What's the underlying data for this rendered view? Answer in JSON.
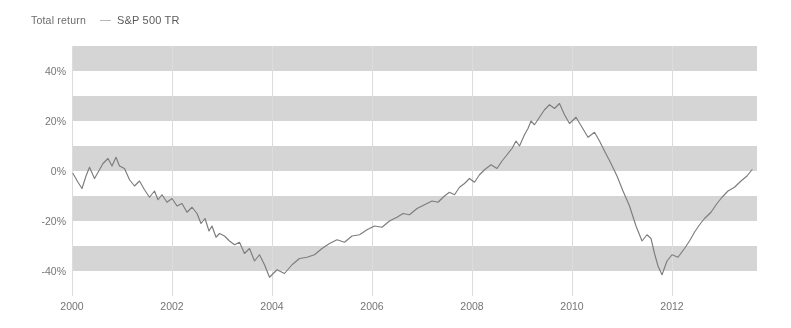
{
  "legend": {
    "title": "Total return",
    "marker_icon": "line-dash-icon",
    "series_label": "S&P 500 TR",
    "series_color": "#737373"
  },
  "colors": {
    "band": "#dedede",
    "background": "#ffffff",
    "axis_text": "#6a6a6a",
    "line": "#737373",
    "gridline": "#e6e6e6"
  },
  "chart_data": {
    "type": "line",
    "title": "Total return",
    "xlabel": "",
    "ylabel": "",
    "xlim": [
      2000.0,
      2013.7
    ],
    "ylim": [
      -50,
      50
    ],
    "yticks": [
      40,
      20,
      0,
      -20,
      -40
    ],
    "ytick_labels": [
      "40%",
      "20%",
      "0%",
      "-20%",
      "-40%"
    ],
    "xticks": [
      2000,
      2002,
      2004,
      2006,
      2008,
      2010,
      2012
    ],
    "xtick_labels": [
      "2000",
      "2002",
      "2004",
      "2006",
      "2008",
      "2010",
      "2012"
    ],
    "grid": "horizontal-bands",
    "band_interval": 10,
    "legend_position": "top-left",
    "series": [
      {
        "name": "S&P 500 TR",
        "color": "#737373",
        "x": [
          2000.02,
          2000.12,
          2000.2,
          2000.28,
          2000.35,
          2000.45,
          2000.55,
          2000.62,
          2000.72,
          2000.8,
          2000.88,
          2000.95,
          2001.05,
          2001.15,
          2001.25,
          2001.35,
          2001.45,
          2001.55,
          2001.65,
          2001.72,
          2001.8,
          2001.9,
          2002.0,
          2002.1,
          2002.2,
          2002.3,
          2002.4,
          2002.5,
          2002.58,
          2002.66,
          2002.74,
          2002.8,
          2002.88,
          2002.95,
          2003.05,
          2003.15,
          2003.25,
          2003.35,
          2003.45,
          2003.55,
          2003.65,
          2003.75,
          2003.85,
          2003.95,
          2004.1,
          2004.25,
          2004.4,
          2004.55,
          2004.7,
          2004.85,
          2005.0,
          2005.15,
          2005.3,
          2005.45,
          2005.6,
          2005.75,
          2005.9,
          2006.05,
          2006.2,
          2006.35,
          2006.5,
          2006.62,
          2006.75,
          2006.9,
          2007.05,
          2007.2,
          2007.32,
          2007.45,
          2007.55,
          2007.65,
          2007.75,
          2007.85,
          2007.95,
          2008.05,
          2008.15,
          2008.25,
          2008.38,
          2008.5,
          2008.6,
          2008.7,
          2008.8,
          2008.88,
          2008.95,
          2009.05,
          2009.12,
          2009.18,
          2009.25,
          2009.35,
          2009.45,
          2009.55,
          2009.65,
          2009.75,
          2009.85,
          2009.95,
          2010.08,
          2010.2,
          2010.32,
          2010.45,
          2010.55,
          2010.65,
          2010.78,
          2010.9,
          2011.02,
          2011.15,
          2011.28,
          2011.4,
          2011.5,
          2011.58,
          2011.65,
          2011.72,
          2011.8,
          2011.9,
          2012.0,
          2012.12,
          2012.25,
          2012.35,
          2012.45,
          2012.55,
          2012.65,
          2012.78,
          2012.9,
          2013.0,
          2013.12,
          2013.25,
          2013.38,
          2013.5,
          2013.6
        ],
        "y": [
          -1.0,
          -4.5,
          -7.0,
          -2.0,
          1.5,
          -3.0,
          0.5,
          3.0,
          5.0,
          2.0,
          5.5,
          2.0,
          1.0,
          -3.5,
          -6.0,
          -4.0,
          -7.5,
          -10.5,
          -8.0,
          -11.5,
          -9.5,
          -12.5,
          -11.0,
          -14.0,
          -13.0,
          -16.5,
          -14.5,
          -17.0,
          -21.0,
          -19.0,
          -24.0,
          -22.0,
          -26.5,
          -25.0,
          -26.0,
          -28.0,
          -29.5,
          -28.5,
          -33.0,
          -31.0,
          -36.0,
          -33.5,
          -37.5,
          -42.5,
          -39.5,
          -41.0,
          -37.5,
          -35.0,
          -34.5,
          -33.5,
          -31.0,
          -29.0,
          -27.5,
          -28.5,
          -26.0,
          -25.5,
          -23.5,
          -22.0,
          -22.5,
          -20.0,
          -18.5,
          -17.0,
          -17.5,
          -15.0,
          -13.5,
          -12.0,
          -12.5,
          -10.0,
          -8.5,
          -9.5,
          -6.5,
          -5.0,
          -3.0,
          -4.5,
          -1.5,
          0.5,
          2.5,
          1.0,
          4.0,
          6.5,
          9.0,
          12.0,
          10.0,
          14.5,
          17.0,
          20.0,
          18.5,
          21.5,
          24.5,
          26.5,
          25.0,
          27.0,
          22.5,
          19.0,
          21.5,
          17.5,
          13.5,
          15.5,
          12.0,
          8.0,
          3.0,
          -2.0,
          -8.0,
          -14.0,
          -22.0,
          -28.0,
          -25.5,
          -27.0,
          -33.0,
          -38.0,
          -41.5,
          -36.0,
          -33.5,
          -34.5,
          -31.0,
          -28.0,
          -24.5,
          -21.5,
          -19.0,
          -16.5,
          -13.0,
          -10.5,
          -8.0,
          -6.5,
          -4.0,
          -2.0,
          0.5
        ]
      }
    ]
  }
}
